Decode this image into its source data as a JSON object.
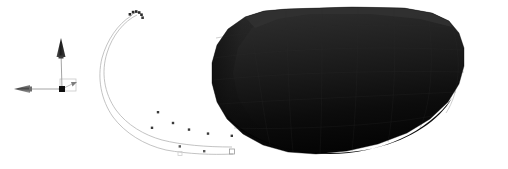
{
  "viewport": {
    "label": "3d-render-viewport",
    "width": 508,
    "height": 169,
    "background_color": "#ffffff",
    "render_style": "flat-shaded-solid"
  },
  "axis_triad": {
    "label": "coordinate-axis-triad",
    "origin": {
      "x": 62,
      "y": 89
    },
    "color": "#8a8a8a",
    "marker_color": "#1a1a1a",
    "axes": [
      {
        "name": "vertical-axis",
        "direction": "up",
        "from": {
          "x": 62,
          "y": 89
        },
        "to": {
          "x": 61,
          "y": 52
        },
        "arrow_color": "#2b2b2b",
        "arrow_length": 18,
        "arrow_width": 9
      },
      {
        "name": "horizontal-axis",
        "direction": "left",
        "from": {
          "x": 62,
          "y": 89
        },
        "to": {
          "x": 29,
          "y": 89
        },
        "arrow_color": "#6e6e6e",
        "arrow_length": 15,
        "arrow_width": 7
      },
      {
        "name": "depth-axis",
        "direction": "right-back",
        "from": {
          "x": 62,
          "y": 89
        },
        "to": {
          "x": 74,
          "y": 83
        },
        "arrow_color": "#9b9b9b",
        "arrow_length": 6,
        "arrow_width": 4
      }
    ],
    "origin_marker": {
      "name": "origin-point-marker",
      "shape": "square",
      "size": 6,
      "color": "#151515"
    },
    "origin_box": {
      "name": "origin-reference-box",
      "x": 60,
      "y": 79,
      "width": 16,
      "height": 12,
      "stroke": "#c9c9c9"
    }
  },
  "curves": {
    "label": "guide-curve-group",
    "stroke_color": "#b4b4b4",
    "stroke_width": 0.8,
    "upper": {
      "name": "upper-guide-curve",
      "path": "M 136 14 L 131 16 C 120 24 110 38 106 55 C 102 72 106 92 118 108 C 128 122 143 133 158 140",
      "points": [
        {
          "x": 136,
          "y": 14
        },
        {
          "x": 158,
          "y": 110
        },
        {
          "x": 166,
          "y": 120
        },
        {
          "x": 178,
          "y": 127
        },
        {
          "x": 194,
          "y": 131
        },
        {
          "x": 208,
          "y": 133
        },
        {
          "x": 232,
          "y": 134
        }
      ]
    },
    "lower": {
      "name": "lower-guide-curve",
      "path": "M 133 15 C 119 22 108 40 104 58 C 100 76 104 96 114 112 C 124 128 140 141 158 149",
      "points": [
        {
          "x": 133,
          "y": 15
        },
        {
          "x": 152,
          "y": 126
        },
        {
          "x": 170,
          "y": 146
        },
        {
          "x": 196,
          "y": 151
        },
        {
          "x": 216,
          "y": 152
        },
        {
          "x": 231,
          "y": 152
        }
      ]
    },
    "point_marker": {
      "name": "curve-point-marker",
      "shape": "square",
      "size": 2.4,
      "color": "#3a3a3a"
    },
    "endpoint_markers": [
      {
        "name": "curve-endpoint-square",
        "x": 232,
        "y": 152,
        "size": 5,
        "stroke": "#9a9a9a",
        "fill": "none"
      },
      {
        "name": "curve-midpoint-square",
        "x": 180,
        "y": 154,
        "size": 4,
        "stroke": "#cfcfcf",
        "fill": "none"
      }
    ],
    "top_cluster": {
      "name": "curve-top-vertex-cluster",
      "points": [
        {
          "x": 130,
          "y": 14
        },
        {
          "x": 133,
          "y": 12
        },
        {
          "x": 136,
          "y": 12
        },
        {
          "x": 139,
          "y": 13
        },
        {
          "x": 141,
          "y": 15
        },
        {
          "x": 142,
          "y": 18
        }
      ],
      "color": "#2a2a2a",
      "size": 2.6
    }
  },
  "solid": {
    "name": "dark-faceted-solid",
    "description": "large dark shaded 3d body",
    "fill_top": "#2a2a2a",
    "fill_mid": "#1b1b1b",
    "fill_bottom": "#050505",
    "silhouette_path": "M 286 9 L 360 7 L 415 9 L 441 16 L 455 26 L 462 39 L 465 57 L 463 76 L 455 95 L 440 114 L 418 131 L 390 144 L 358 152 L 325 155 L 295 153 L 268 146 L 247 135 L 230 120 L 219 103 L 213 84 L 212 64 L 216 45 L 226 29 L 243 17 L 264 11 Z",
    "facet_stroke": "#242424",
    "facet_opacity": 0.35
  }
}
